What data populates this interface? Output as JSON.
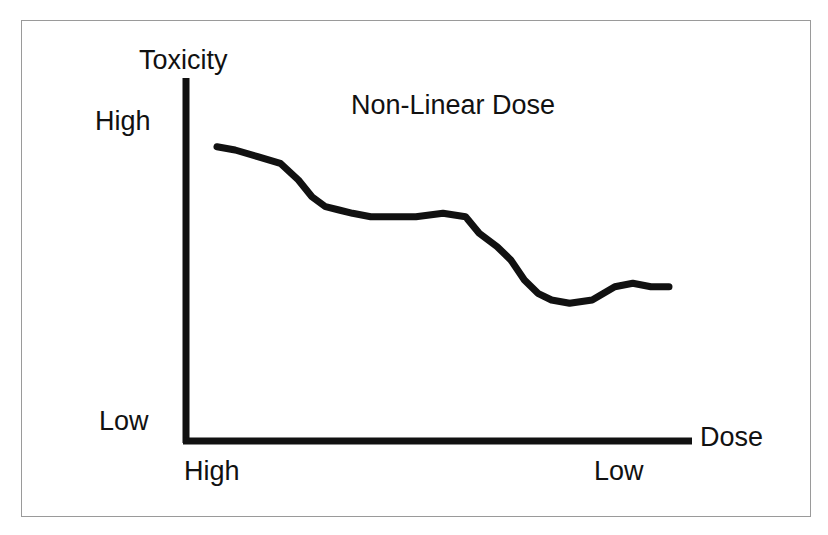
{
  "figure": {
    "background_color": "#ffffff",
    "frame_color": "#9a9a9a",
    "ink_color": "#111111"
  },
  "chart_data": {
    "type": "line",
    "title": "Non-Linear Dose",
    "xlabel": "Dose",
    "ylabel": "Toxicity",
    "grid": false,
    "legend": null,
    "axis_ticks": {
      "y": [
        "High",
        "Low"
      ],
      "x": [
        "High",
        "Low"
      ]
    },
    "axis_note": "Both axes run from High (at origin) to Low (away from origin); Toxicity decreases in a stepped, non-linear fashion as Dose decreases.",
    "xlim": [
      0,
      100
    ],
    "ylim": [
      0,
      100
    ],
    "series": [
      {
        "name": "Toxicity vs Dose",
        "line_color": "#111111",
        "line_width": 7,
        "x": [
          0,
          4,
          9,
          14,
          18,
          21,
          24,
          27,
          30,
          34,
          38,
          44,
          50,
          55,
          58,
          62,
          65,
          68,
          71,
          74,
          78,
          83,
          88,
          92,
          96,
          100
        ],
        "y": [
          84,
          83,
          81,
          79,
          74,
          69,
          66,
          65,
          64,
          63,
          63,
          63,
          64,
          63,
          58,
          54,
          50,
          44,
          40,
          38,
          37,
          38,
          42,
          43,
          42,
          42
        ]
      }
    ]
  },
  "labels": {
    "y_axis_title": "Toxicity",
    "x_axis_title": "Dose",
    "title": "Non-Linear Dose",
    "y_high": "High",
    "y_low": "Low",
    "x_high": "High",
    "x_low": "Low"
  }
}
